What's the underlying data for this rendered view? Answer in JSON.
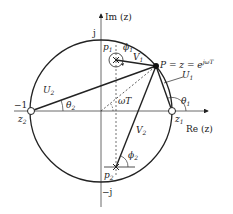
{
  "diagram": {
    "type": "z-plane pole-zero geometry",
    "axes": {
      "imag_label": "Im (z)",
      "real_label": "Re (z)",
      "j_label": "j",
      "neg_j_label": "−j",
      "neg_one_label": "−1"
    },
    "points": {
      "P_label": "P = z = e",
      "P_exp": "jωT",
      "p1": "p",
      "p1_sub": "1",
      "p2": "p",
      "p2_sub": "2",
      "z1": "z",
      "z1_sub": "1",
      "z2": "z",
      "z2_sub": "2"
    },
    "vectors": {
      "U1": "U",
      "U1_sub": "1",
      "U2": "U",
      "U2_sub": "2",
      "V1": "V",
      "V1_sub": "1",
      "V2": "V",
      "V2_sub": "2"
    },
    "angles": {
      "theta1": "θ",
      "theta1_sub": "1",
      "theta2": "θ",
      "theta2_sub": "2",
      "phi1": "ϕ",
      "phi1_sub": "1",
      "phi2": "ϕ",
      "phi2_sub": "2",
      "omegaT": "ωT"
    },
    "colors": {
      "stroke": "#222222",
      "dashed": "#333333"
    }
  }
}
